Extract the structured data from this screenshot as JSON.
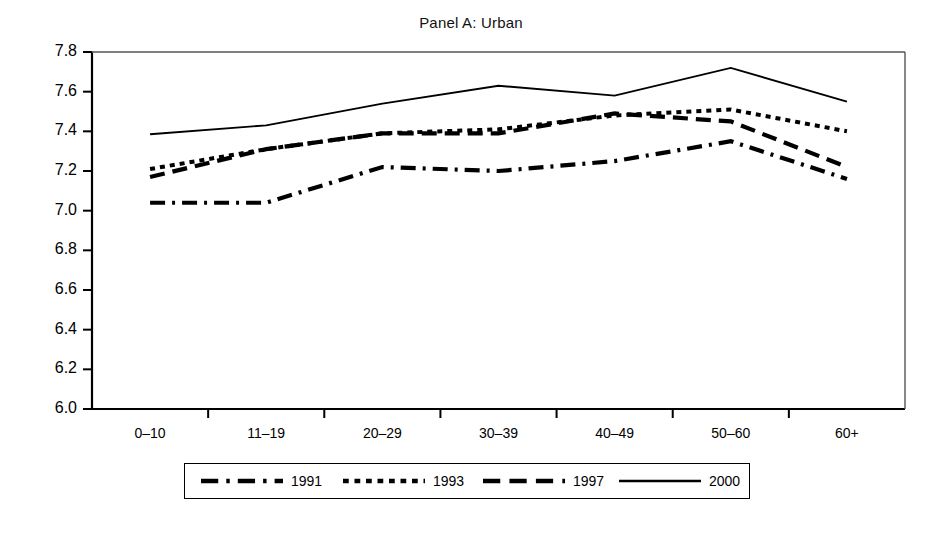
{
  "chart_data": {
    "type": "line",
    "title": "Panel A: Urban",
    "xlabel": "",
    "ylabel": "",
    "ylim": [
      6.0,
      7.8
    ],
    "yticks": [
      "6.0",
      "6.2",
      "6.4",
      "6.6",
      "6.8",
      "7.0",
      "7.2",
      "7.4",
      "7.6",
      "7.8"
    ],
    "grid": false,
    "legend_position": "below-axes",
    "categories": [
      "0–10",
      "11–19",
      "20–29",
      "30–39",
      "40–49",
      "50–60",
      "60+"
    ],
    "series": [
      {
        "name": "1991",
        "style": "dash-dot",
        "values": [
          7.04,
          7.04,
          7.22,
          7.2,
          7.25,
          7.35,
          7.16
        ]
      },
      {
        "name": "1993",
        "style": "dotted",
        "values": [
          7.21,
          7.31,
          7.39,
          7.41,
          7.48,
          7.51,
          7.4
        ]
      },
      {
        "name": "1997",
        "style": "dashed",
        "values": [
          7.17,
          7.31,
          7.39,
          7.39,
          7.49,
          7.45,
          7.22
        ]
      },
      {
        "name": "2000",
        "style": "solid",
        "values": [
          7.385,
          7.43,
          7.54,
          7.63,
          7.58,
          7.72,
          7.55
        ]
      }
    ]
  },
  "legend": {
    "items": [
      {
        "label": "1991",
        "style": "dash-dot"
      },
      {
        "label": "1993",
        "style": "dotted"
      },
      {
        "label": "1997",
        "style": "dashed"
      },
      {
        "label": "2000",
        "style": "solid"
      }
    ]
  },
  "colors": {
    "line": "#000000",
    "axis": "#000000",
    "background": "#ffffff"
  }
}
